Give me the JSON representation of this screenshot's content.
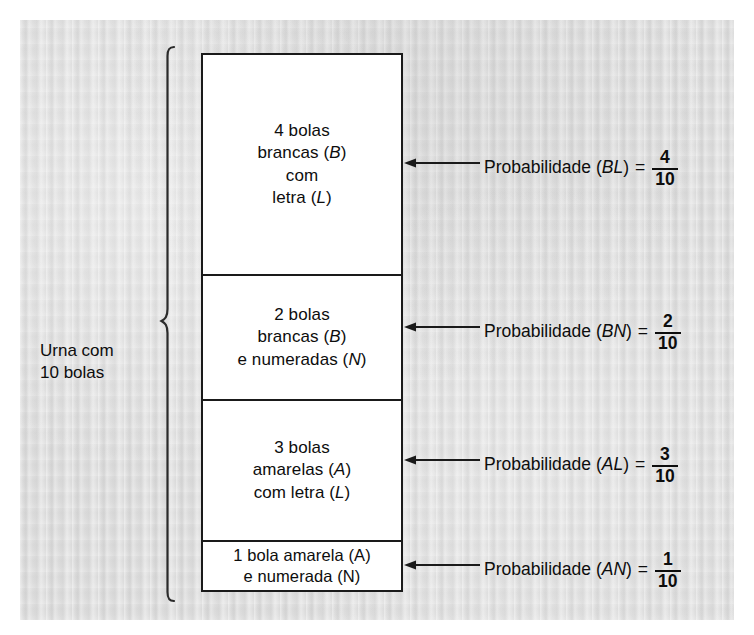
{
  "figure": {
    "background_color": "#dddddd",
    "line_color": "#1a1a1a",
    "box_fill": "#ffffff"
  },
  "left_label": {
    "line1": "Urna com",
    "line2": "10 bolas"
  },
  "urn": {
    "cells": [
      {
        "id": "bolas-brancas-letra",
        "lines": [
          "4 bolas",
          "brancas (B)",
          "com",
          "letra (L)"
        ],
        "count": 4,
        "italic_symbols": [
          "B",
          "L"
        ]
      },
      {
        "id": "bolas-brancas-numeradas",
        "lines": [
          "2 bolas",
          "brancas (B)",
          "e numeradas (N)"
        ],
        "count": 2,
        "italic_symbols": [
          "B",
          "N"
        ]
      },
      {
        "id": "bolas-amarelas-letra",
        "lines": [
          "3 bolas",
          "amarelas (A)",
          "com letra (L)"
        ],
        "count": 3,
        "italic_symbols": [
          "A",
          "L"
        ]
      },
      {
        "id": "bola-amarela-numerada",
        "lines": [
          "1 bola amarela (A)",
          "e numerada (N)"
        ],
        "count": 1,
        "italic_symbols": []
      }
    ]
  },
  "probabilities": [
    {
      "id": "prob-BL",
      "prefix": "Probabilidade (",
      "event": "BL",
      "suffix": ")",
      "equals": "=",
      "numerator": "4",
      "denominator": "10"
    },
    {
      "id": "prob-BN",
      "prefix": "Probabilidade (",
      "event": "BN",
      "suffix": ")",
      "equals": "=",
      "numerator": "2",
      "denominator": "10"
    },
    {
      "id": "prob-AL",
      "prefix": "Probabilidade (",
      "event": "AL",
      "suffix": ")",
      "equals": "=",
      "numerator": "3",
      "denominator": "10"
    },
    {
      "id": "prob-AN",
      "prefix": "Probabilidade (",
      "event": "AN",
      "suffix": ")",
      "equals": "=",
      "numerator": "1",
      "denominator": "10"
    }
  ],
  "chart_data": {
    "type": "bar",
    "title": "Urna com 10 bolas",
    "categories": [
      "BL",
      "BN",
      "AL",
      "AN"
    ],
    "category_labels": [
      "4 bolas brancas (B) com letra (L)",
      "2 bolas brancas (B) e numeradas (N)",
      "3 bolas amarelas (A) com letra (L)",
      "1 bola amarela (A) e numerada (N)"
    ],
    "values": [
      4,
      2,
      3,
      1
    ],
    "probabilities": [
      0.4,
      0.2,
      0.3,
      0.1
    ],
    "probability_fractions": [
      "4/10",
      "2/10",
      "3/10",
      "1/10"
    ],
    "total": 10,
    "xlabel": "",
    "ylabel": "Número de bolas",
    "ylim": [
      0,
      10
    ],
    "grid": false,
    "legend": "none"
  }
}
